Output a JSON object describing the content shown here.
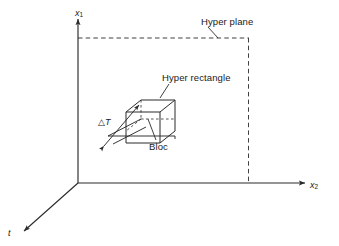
{
  "figure": {
    "domain": "diagram",
    "background_color": "#ffffff",
    "line_color": "#2b2b2b",
    "text_color": "#1a1a1a",
    "width": 339,
    "height": 246
  },
  "axes": {
    "x1": {
      "label": "x",
      "subscript": "1",
      "direction": "up",
      "style": "solid-arrow"
    },
    "x2": {
      "label": "x",
      "subscript": "2",
      "direction": "right",
      "style": "solid-arrow"
    },
    "t": {
      "label": "t",
      "subscript": "",
      "direction": "down-left-oblique",
      "style": "solid-arrow"
    }
  },
  "annotations": {
    "hyper_plane": "Hyper plane",
    "hyper_rectangle": "Hyper rectangle",
    "bloc": "Bloc",
    "delta_t_symbol": "△",
    "delta_t_letter": "T"
  },
  "shapes": {
    "hyper_plane": {
      "style": "dashed",
      "corner_x": 248,
      "top_y": 38,
      "origin_x": 78,
      "base_y": 183
    },
    "hyper_rectangle": {
      "style": "solid-with-hidden-dashed",
      "note": "cube in 3D oblique projection"
    },
    "slab": {
      "style": "solid",
      "note": "thin slab of thickness delta-T extending along t axis"
    },
    "dimension_arrow": {
      "style": "double-headed",
      "measures": "delta-T"
    }
  }
}
